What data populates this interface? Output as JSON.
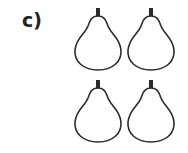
{
  "label": "c)",
  "colors": {
    "outline": "#2a2a2a",
    "background": "#ffffff"
  },
  "pears": [
    {
      "icon": "pear-icon",
      "row": 1,
      "col": 1
    },
    {
      "icon": "pear-icon",
      "row": 1,
      "col": 2
    },
    {
      "icon": "pear-icon",
      "row": 2,
      "col": 1
    },
    {
      "icon": "pear-icon",
      "row": 2,
      "col": 2
    }
  ],
  "count": 4
}
